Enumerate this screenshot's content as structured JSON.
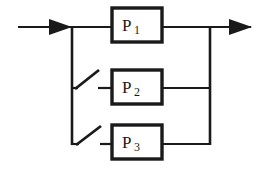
{
  "diagram": {
    "type": "reliability-block-diagram",
    "background_color": "#ffffff",
    "line_color": "#1a1a1a",
    "block_border_color": "#1a1a1a",
    "block_fill_color": "#ffffff",
    "input": {
      "label": "",
      "arrow_name": "input-arrow",
      "direction": "right"
    },
    "output": {
      "label": "",
      "arrow_name": "output-arrow",
      "direction": "right"
    },
    "blocks": [
      {
        "id": "p1",
        "label": "P",
        "subscript": "1",
        "row": 1,
        "has_switch": false
      },
      {
        "id": "p2",
        "label": "P",
        "subscript": "2",
        "row": 2,
        "has_switch": true
      },
      {
        "id": "p3",
        "label": "P",
        "subscript": "3",
        "row": 3,
        "has_switch": true
      }
    ],
    "switches": [
      {
        "id": "switch-p2",
        "state": "open",
        "for_block": "p2"
      },
      {
        "id": "switch-p3",
        "state": "open",
        "for_block": "p3"
      }
    ],
    "buses": [
      {
        "id": "input-bus",
        "orientation": "vertical"
      },
      {
        "id": "output-bus",
        "orientation": "vertical"
      }
    ]
  }
}
